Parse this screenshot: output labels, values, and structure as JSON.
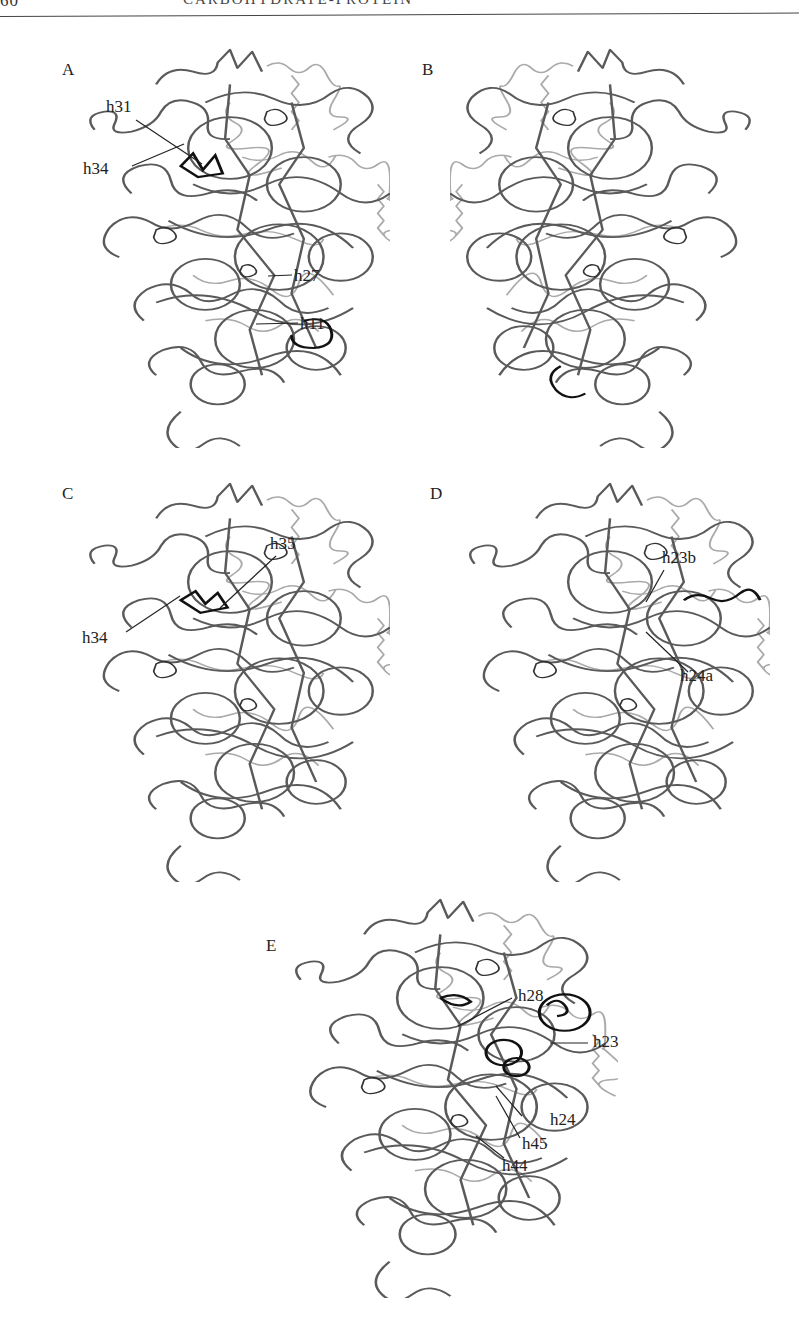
{
  "running_head": {
    "page_number_fragment": "60",
    "title_fragment": "CARBOHYDRATE-PROTEIN"
  },
  "figure": {
    "type": "ribosome small subunit (30S) structure views with labeled 16S rRNA helices",
    "panels": [
      {
        "id": "A",
        "letter": "A",
        "labels": [
          "h31",
          "h34",
          "h27",
          "h11"
        ]
      },
      {
        "id": "B",
        "letter": "B",
        "labels": []
      },
      {
        "id": "C",
        "letter": "C",
        "labels": [
          "h35",
          "h34"
        ]
      },
      {
        "id": "D",
        "letter": "D",
        "labels": [
          "h23b",
          "h24a"
        ]
      },
      {
        "id": "E",
        "letter": "E",
        "labels": [
          "h28",
          "h23",
          "h24",
          "h45",
          "h44"
        ]
      }
    ]
  },
  "colors": {
    "rna_backbone": "#555555",
    "protein": "#a8a8a8",
    "highlight": "#111111",
    "leader_line": "#222222"
  }
}
